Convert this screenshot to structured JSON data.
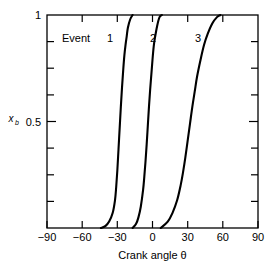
{
  "chart_data": {
    "type": "line",
    "title": "",
    "xlabel": "Crank angle θ",
    "ylabel": "x_b",
    "ylabel_main": "x",
    "ylabel_sub": "b",
    "xlim": [
      -90,
      90
    ],
    "ylim": [
      0,
      1
    ],
    "xticks": [
      -90,
      -60,
      -30,
      0,
      30,
      60,
      90
    ],
    "xtick_labels": [
      "−90",
      "−60",
      "−30",
      "0",
      "30",
      "60",
      "90"
    ],
    "yticks": [
      0,
      0.125,
      0.25,
      0.375,
      0.5,
      0.625,
      0.75,
      0.875,
      1
    ],
    "ytick_labels_shown": {
      "1": "1",
      "0.5": "0.5"
    },
    "grid": false,
    "legend_position": "in-plot-top-left",
    "legend_word": "Event",
    "series": [
      {
        "name": "1",
        "label": "1",
        "color": "#000000",
        "midpoint_x": -27,
        "x": [
          -44,
          -40,
          -37,
          -34,
          -32,
          -31,
          -30,
          -29,
          -28,
          -27,
          -26,
          -25,
          -24,
          -23,
          -22,
          -21,
          -19,
          -17
        ],
        "y": [
          0.0,
          0.01,
          0.03,
          0.07,
          0.13,
          0.19,
          0.27,
          0.37,
          0.47,
          0.57,
          0.66,
          0.74,
          0.81,
          0.86,
          0.9,
          0.94,
          0.98,
          1.0
        ]
      },
      {
        "name": "2",
        "label": "2",
        "color": "#000000",
        "midpoint_x": -4,
        "x": [
          -17,
          -14,
          -12,
          -10,
          -8,
          -7,
          -6,
          -5,
          -4,
          -3,
          -2,
          -1,
          0,
          1,
          2,
          4,
          6,
          8
        ],
        "y": [
          0.0,
          0.02,
          0.05,
          0.1,
          0.18,
          0.24,
          0.31,
          0.39,
          0.48,
          0.57,
          0.65,
          0.72,
          0.79,
          0.85,
          0.89,
          0.95,
          0.99,
          1.0
        ]
      },
      {
        "name": "3",
        "label": "3",
        "color": "#000000",
        "midpoint_x": 30,
        "x": [
          7,
          13,
          17,
          21,
          24,
          26,
          28,
          30,
          32,
          34,
          36,
          38,
          41,
          44,
          47,
          51,
          55,
          58
        ],
        "y": [
          0.0,
          0.03,
          0.07,
          0.13,
          0.2,
          0.26,
          0.33,
          0.41,
          0.49,
          0.57,
          0.64,
          0.71,
          0.79,
          0.86,
          0.91,
          0.96,
          0.99,
          1.0
        ]
      }
    ],
    "series_label_positions": [
      {
        "label": "1",
        "x": -49,
        "y": 0.87
      },
      {
        "label": "2",
        "x": -12,
        "y": 0.87
      },
      {
        "label": "3",
        "x": 26,
        "y": 0.87
      }
    ]
  },
  "axis": {
    "x_title": "Crank angle θ",
    "y_title_main": "x",
    "y_title_sub": "b",
    "x_tick_labels": [
      "−90",
      "−60",
      "−30",
      "0",
      "30",
      "60",
      "90"
    ],
    "y_tick_label_top": "1",
    "y_tick_label_mid": "0.5"
  },
  "legend": {
    "word": "Event",
    "items": [
      "1",
      "2",
      "3"
    ]
  },
  "colors": {
    "line": "#000000",
    "axis": "#000000",
    "background": "#ffffff"
  }
}
